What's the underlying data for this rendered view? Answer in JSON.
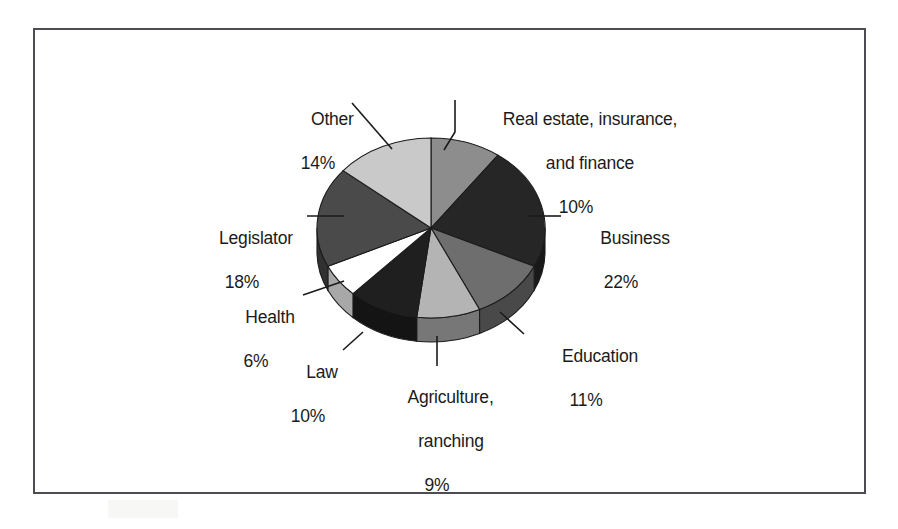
{
  "figure": {
    "kind": "pie-chart-figure",
    "background_color": "#ffffff",
    "frame_color": "#4c4c52"
  },
  "chart_data": {
    "type": "pie",
    "title": "",
    "subtitle": "",
    "xlabel": "",
    "ylabel": "",
    "legend_position": "none",
    "grid": false,
    "value_unit": "percent",
    "three_d": true,
    "start_angle_deg": 0,
    "direction": "clockwise",
    "categories": [
      "Real estate, insurance, and finance",
      "Business",
      "Education",
      "Agriculture, ranching",
      "Law",
      "Health",
      "Legislator",
      "Other"
    ],
    "values": [
      10,
      22,
      11,
      9,
      10,
      6,
      18,
      14
    ],
    "colors": [
      "#8d8d8d",
      "#262626",
      "#6e6e6e",
      "#b4b4b4",
      "#1f1f1f",
      "#ffffff",
      "#4a4a4a",
      "#c9c9c9"
    ],
    "slices": [
      {
        "label": "Real estate, insurance, and finance",
        "value": 10,
        "value_label": "10%",
        "color": "#8d8d8d"
      },
      {
        "label": "Business",
        "value": 22,
        "value_label": "22%",
        "color": "#262626"
      },
      {
        "label": "Education",
        "value": 11,
        "value_label": "11%",
        "color": "#6e6e6e"
      },
      {
        "label": "Agriculture, ranching",
        "value": 9,
        "value_label": "9%",
        "color": "#b4b4b4"
      },
      {
        "label": "Law",
        "value": 10,
        "value_label": "10%",
        "color": "#1f1f1f"
      },
      {
        "label": "Health",
        "value": 6,
        "value_label": "6%",
        "color": "#ffffff"
      },
      {
        "label": "Legislator",
        "value": 18,
        "value_label": "18%",
        "color": "#4a4a4a"
      },
      {
        "label": "Other",
        "value": 14,
        "value_label": "14%",
        "color": "#c9c9c9"
      }
    ]
  },
  "labels": {
    "real_estate": {
      "line1": "Real estate, insurance,",
      "line2": "and finance",
      "pct": "10%"
    },
    "business": {
      "line1": "Business",
      "pct": "22%"
    },
    "education": {
      "line1": "Education",
      "pct": "11%"
    },
    "agriculture": {
      "line1": "Agriculture,",
      "line2": "ranching",
      "pct": "9%"
    },
    "law": {
      "line1": "Law",
      "pct": "10%"
    },
    "health": {
      "line1": "Health",
      "pct": "6%"
    },
    "legislator": {
      "line1": "Legislator",
      "pct": "18%"
    },
    "other": {
      "line1": "Other",
      "pct": "14%"
    }
  }
}
